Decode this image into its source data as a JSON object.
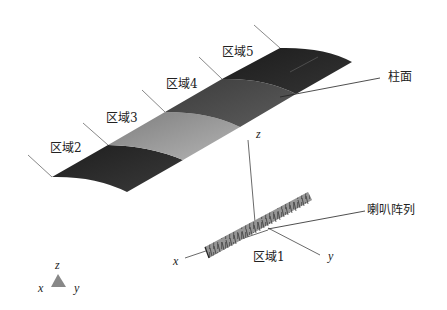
{
  "diagram": {
    "type": "3d-schematic",
    "surface": {
      "label": "柱面",
      "regions": [
        {
          "id": "region-2",
          "label": "区域2",
          "color": "#2a2a2a"
        },
        {
          "id": "region-3",
          "label": "区域3",
          "color": "#9a9a9a"
        },
        {
          "id": "region-4",
          "label": "区域4",
          "color": "#4e4e4e"
        },
        {
          "id": "region-5",
          "label": "区域5",
          "color": "#262626"
        }
      ]
    },
    "array": {
      "label": "喇叭阵列",
      "region_label": "区域1",
      "color": "#8c8c8c"
    },
    "axes": {
      "x": "x",
      "y": "y",
      "z": "z"
    },
    "triad": {
      "x": "x",
      "y": "y",
      "z": "z",
      "color": "#888888"
    }
  }
}
